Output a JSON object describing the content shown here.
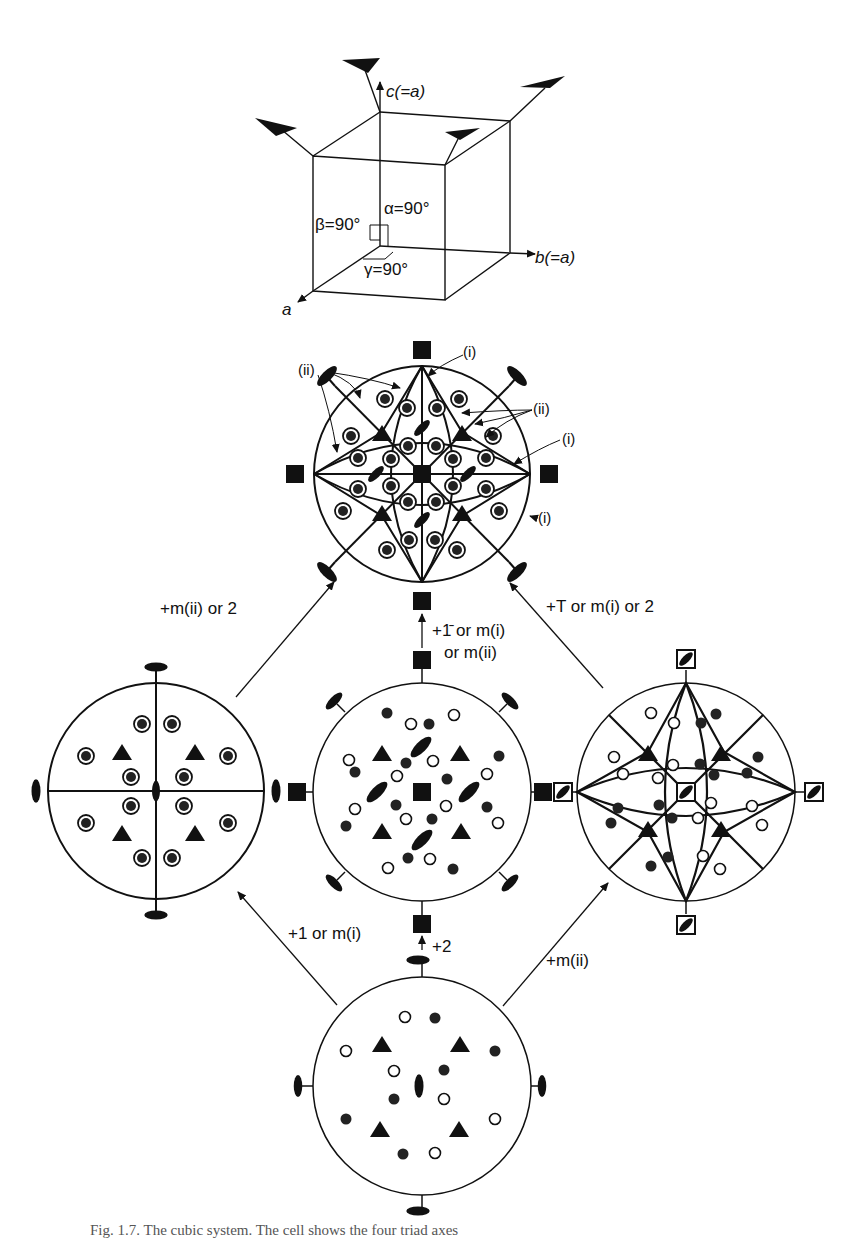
{
  "figure": {
    "cube": {
      "axis_c": "c(=a)",
      "axis_b": "b(=a)",
      "axis_a": "a",
      "alpha": "α=90°",
      "beta": "β=90°",
      "gamma": "γ=90°"
    },
    "top_projection": {
      "labels": {
        "ii_left": "(ii)",
        "i_top": "(i)",
        "ii_right": "(ii)",
        "i_right": "(i)",
        "i_lower_right": "(i)"
      }
    },
    "arrows": {
      "left_to_top": "+m(ii) or 2",
      "middle_to_top_line1": "+1̄ or m(i)",
      "middle_to_top_line2": "or m(ii)",
      "right_to_top": "+T or m(i) or 2",
      "bottom_to_left": "+1 or m(i)",
      "bottom_to_middle": "+2",
      "bottom_to_right": "+m(ii)"
    },
    "caption": "Fig. 1.7. The cubic system. The cell shows the four triad axes"
  }
}
